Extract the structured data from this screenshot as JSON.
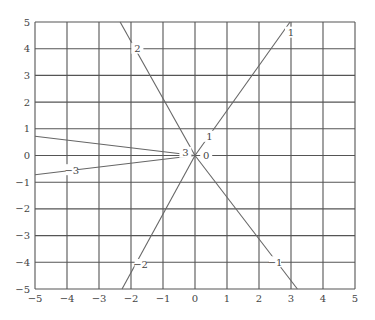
{
  "chart_data": {
    "type": "line",
    "title": "",
    "xlabel": "",
    "ylabel": "",
    "xlim": [
      -5,
      5
    ],
    "ylim": [
      -5,
      5
    ],
    "grid": true,
    "legend": "none",
    "x_ticks": [
      -5,
      -4,
      -3,
      -2,
      -1,
      0,
      1,
      2,
      3,
      4,
      5
    ],
    "y_ticks": [
      -5,
      -4,
      -3,
      -2,
      -1,
      0,
      1,
      2,
      3,
      4,
      5
    ],
    "x_tick_labels": [
      "−5",
      "−4",
      "−3",
      "−2",
      "−1",
      "0",
      "1",
      "2",
      "3",
      "4",
      "5"
    ],
    "y_tick_labels": [
      "−5",
      "−4",
      "−3",
      "−2",
      "−1",
      "0",
      "1",
      "2",
      "3",
      "4",
      "5"
    ],
    "series": [
      {
        "name": "1",
        "points": [
          [
            0,
            0
          ],
          [
            2.97,
            5
          ]
        ],
        "labels": [
          {
            "text": "1",
            "x": 0.45,
            "y": 0.7
          },
          {
            "text": "1",
            "x": 3.0,
            "y": 4.6
          }
        ]
      },
      {
        "name": "2",
        "points": [
          [
            0,
            0
          ],
          [
            -2.34,
            5
          ]
        ],
        "labels": [
          {
            "text": "2",
            "x": -1.8,
            "y": 4.0
          }
        ]
      },
      {
        "name": "-1",
        "points": [
          [
            0,
            0
          ],
          [
            3.2,
            -5
          ]
        ],
        "labels": [
          {
            "text": "−1",
            "x": 2.5,
            "y": -4.0
          }
        ]
      },
      {
        "name": "-2",
        "points": [
          [
            0,
            0
          ],
          [
            -2.28,
            -5
          ]
        ],
        "labels": [
          {
            "text": "−2",
            "x": -1.7,
            "y": -4.1
          }
        ]
      },
      {
        "name": "3",
        "points": [
          [
            -5,
            0.72
          ],
          [
            0,
            0
          ]
        ],
        "labels": [
          {
            "text": "3",
            "x": -0.3,
            "y": 0.1
          }
        ]
      },
      {
        "name": "-3",
        "points": [
          [
            -5,
            -0.72
          ],
          [
            0,
            0
          ]
        ],
        "labels": [
          {
            "text": "−3",
            "x": -3.85,
            "y": -0.55
          }
        ]
      },
      {
        "name": "0",
        "points": [
          [
            0,
            0
          ]
        ],
        "labels": [
          {
            "text": "0",
            "x": 0.35,
            "y": 0.0
          }
        ]
      }
    ]
  },
  "colors": {
    "grid": "#555555",
    "line": "#666666",
    "text": "#444444",
    "background": "#ffffff"
  }
}
